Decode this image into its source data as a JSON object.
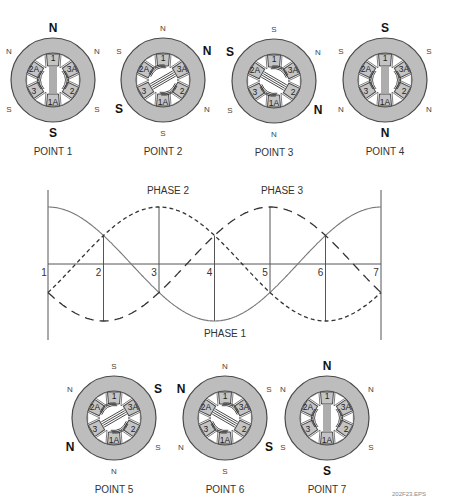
{
  "colors": {
    "ring": "#bdbdbd",
    "pole_fill": "#c4c4c4",
    "stroke": "#4a4a4a",
    "wave": "#555555",
    "text": "#333333"
  },
  "motors": [
    {
      "label": "POINT 1",
      "cx": 53,
      "cy": 80,
      "rotor": "vertical",
      "poles": {
        "top": {
          "t": "N",
          "big": true
        },
        "bottom": {
          "t": "S",
          "big": true
        },
        "ul": {
          "t": "N",
          "big": false
        },
        "ur": {
          "t": "N",
          "big": false
        },
        "ll": {
          "t": "S",
          "big": false
        },
        "lr": {
          "t": "S",
          "big": false
        }
      }
    },
    {
      "label": "POINT 2",
      "cx": 163,
      "cy": 80,
      "rotor": "diag-up",
      "poles": {
        "top": {
          "t": "N",
          "big": false
        },
        "bottom": {
          "t": "S",
          "big": false
        },
        "ul": {
          "t": "S",
          "big": false
        },
        "ur": {
          "t": "N",
          "big": true
        },
        "ll": {
          "t": "S",
          "big": true
        },
        "lr": {
          "t": "N",
          "big": false
        }
      }
    },
    {
      "label": "POINT 3",
      "cx": 274,
      "cy": 81,
      "rotor": "diag-down",
      "poles": {
        "top": {
          "t": "S",
          "big": false
        },
        "bottom": {
          "t": "N",
          "big": false
        },
        "ul": {
          "t": "S",
          "big": true
        },
        "ur": {
          "t": "N",
          "big": false
        },
        "ll": {
          "t": "S",
          "big": false
        },
        "lr": {
          "t": "N",
          "big": true
        }
      }
    },
    {
      "label": "POINT 4",
      "cx": 385,
      "cy": 80,
      "rotor": "vertical",
      "poles": {
        "top": {
          "t": "S",
          "big": true
        },
        "bottom": {
          "t": "N",
          "big": true
        },
        "ul": {
          "t": "S",
          "big": false
        },
        "ur": {
          "t": "S",
          "big": false
        },
        "ll": {
          "t": "N",
          "big": false
        },
        "lr": {
          "t": "N",
          "big": false
        }
      }
    },
    {
      "label": "POINT 5",
      "cx": 114,
      "cy": 418,
      "rotor": "diag-up",
      "poles": {
        "top": {
          "t": "S",
          "big": false
        },
        "bottom": {
          "t": "N",
          "big": false
        },
        "ul": {
          "t": "N",
          "big": false
        },
        "ur": {
          "t": "S",
          "big": true
        },
        "ll": {
          "t": "N",
          "big": true
        },
        "lr": {
          "t": "S",
          "big": false
        }
      }
    },
    {
      "label": "POINT 6",
      "cx": 225,
      "cy": 418,
      "rotor": "diag-down",
      "poles": {
        "top": {
          "t": "N",
          "big": false
        },
        "bottom": {
          "t": "S",
          "big": false
        },
        "ul": {
          "t": "N",
          "big": true
        },
        "ur": {
          "t": "S",
          "big": false
        },
        "ll": {
          "t": "N",
          "big": false
        },
        "lr": {
          "t": "S",
          "big": true
        }
      }
    },
    {
      "label": "POINT 7",
      "cx": 327,
      "cy": 418,
      "rotor": "vertical",
      "poles": {
        "top": {
          "t": "N",
          "big": true
        },
        "bottom": {
          "t": "S",
          "big": true
        },
        "ul": {
          "t": "N",
          "big": false
        },
        "ur": {
          "t": "N",
          "big": false
        },
        "ll": {
          "t": "S",
          "big": false
        },
        "lr": {
          "t": "S",
          "big": false
        }
      }
    }
  ],
  "stator_labels": [
    "1",
    "3A",
    "2",
    "1A",
    "3",
    "2A"
  ],
  "graph": {
    "x0": 48,
    "x1": 381,
    "baseline": 264,
    "amplitude": 57,
    "axis_top": 190,
    "axis_bottom": 340,
    "points": [
      "1",
      "2",
      "3",
      "4",
      "5",
      "6",
      "7"
    ],
    "phases": [
      {
        "name": "PHASE 1",
        "style": "solid",
        "offset_deg": 0,
        "label_x": 225,
        "label_y": 333
      },
      {
        "name": "PHASE 2",
        "style": "dotted",
        "offset_deg": 120,
        "label_x": 168,
        "label_y": 190
      },
      {
        "name": "PHASE 3",
        "style": "dashed",
        "offset_deg": 240,
        "label_x": 282,
        "label_y": 190
      }
    ]
  },
  "footer": {
    "file_label": "202F23.EPS"
  },
  "chart_data": {
    "type": "line",
    "title": "",
    "xlabel": "",
    "ylabel": "",
    "x": [
      1,
      2,
      3,
      4,
      5,
      6,
      7
    ],
    "series": [
      {
        "name": "PHASE 1",
        "style": "solid",
        "values": [
          1.0,
          0.5,
          -0.5,
          -1.0,
          -0.5,
          0.5,
          1.0
        ]
      },
      {
        "name": "PHASE 2",
        "style": "dotted",
        "values": [
          -0.5,
          0.5,
          1.0,
          0.5,
          -0.5,
          -1.0,
          -0.5
        ]
      },
      {
        "name": "PHASE 3",
        "style": "dashed",
        "values": [
          -0.5,
          -1.0,
          -0.5,
          0.5,
          1.0,
          0.5,
          -0.5
        ]
      }
    ],
    "grid": "vertical lines at each point",
    "legend": "inline labels (PHASE 1 below, PHASE 2 and PHASE 3 above)"
  }
}
